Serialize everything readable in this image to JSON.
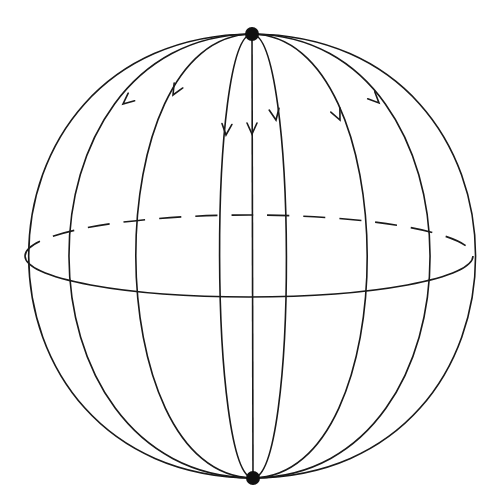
{
  "figure": {
    "colors": {
      "stroke": "#1a1a1a",
      "pole": "#111111",
      "background": "#ffffff"
    },
    "sphere": {
      "cx": 249,
      "cy": 256,
      "rx": 224,
      "ry": 222
    },
    "equator": {
      "cx": 249,
      "cy": 256,
      "rx": 224,
      "ry": 41,
      "back_half": "dashed",
      "front_half": "solid"
    },
    "poles": [
      {
        "name": "north-pole",
        "x": 252,
        "y": 34,
        "r": 7
      },
      {
        "name": "south-pole",
        "x": 253,
        "y": 478,
        "r": 7
      }
    ],
    "meridians_equator_x": [
      68,
      135,
      219,
      253,
      286,
      367,
      430
    ],
    "arrow_direction": "downward (north to south)",
    "arrow_count": 7
  }
}
